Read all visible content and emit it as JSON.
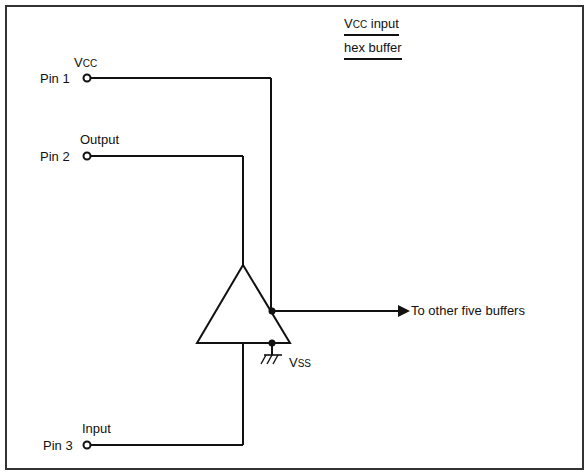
{
  "title": {
    "line1_main": "V",
    "line1_sub": "CC",
    "line1_rest": " input",
    "line2": "hex buffer"
  },
  "pins": [
    {
      "pin_label": "Pin 1",
      "signal_main": "V",
      "signal_sub": "CC"
    },
    {
      "pin_label": "Pin 2",
      "signal": "Output"
    },
    {
      "pin_label": "Pin 3",
      "signal": "Input"
    }
  ],
  "ground": {
    "main": "V",
    "sub": "SS"
  },
  "output_arrow_label": "To other five buffers",
  "colors": {
    "line": "#111111",
    "background": "#ffffff",
    "frame": "#333333"
  }
}
